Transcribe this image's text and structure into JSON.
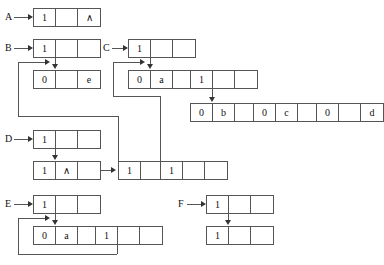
{
  "diagram": {
    "type": "pointer-diagram",
    "labels": [
      {
        "id": "A",
        "text": "A",
        "x": 5,
        "y": 12
      },
      {
        "id": "B",
        "text": "B",
        "x": 5,
        "y": 43
      },
      {
        "id": "C",
        "text": "C",
        "x": 103,
        "y": 43
      },
      {
        "id": "D",
        "text": "D",
        "x": 5,
        "y": 134
      },
      {
        "id": "E",
        "text": "E",
        "x": 5,
        "y": 199
      },
      {
        "id": "F",
        "text": "F",
        "x": 178,
        "y": 199
      }
    ],
    "nodes": [
      {
        "id": "A1",
        "x": 33,
        "y": 8,
        "cells": [
          "1",
          "",
          "∧"
        ]
      },
      {
        "id": "B1",
        "x": 33,
        "y": 39,
        "cells": [
          "1",
          "",
          ""
        ]
      },
      {
        "id": "B2",
        "x": 33,
        "y": 70,
        "cells": [
          "0",
          "",
          "e"
        ]
      },
      {
        "id": "C1",
        "x": 128,
        "y": 39,
        "cells": [
          "1",
          "",
          ""
        ]
      },
      {
        "id": "C2",
        "x": 128,
        "y": 70,
        "cells": [
          "0",
          "a",
          ""
        ]
      },
      {
        "id": "C3",
        "x": 190,
        "y": 70,
        "cells": [
          "1",
          "",
          ""
        ]
      },
      {
        "id": "C4",
        "x": 190,
        "y": 103,
        "cells": [
          "0",
          "b",
          ""
        ]
      },
      {
        "id": "C5",
        "x": 253,
        "y": 103,
        "cells": [
          "0",
          "c",
          ""
        ]
      },
      {
        "id": "C6",
        "x": 316,
        "y": 103,
        "cells": [
          "0",
          "",
          "d"
        ]
      },
      {
        "id": "D1",
        "x": 33,
        "y": 130,
        "cells": [
          "1",
          "",
          ""
        ]
      },
      {
        "id": "D2",
        "x": 33,
        "y": 161,
        "cells": [
          "1",
          "∧",
          ""
        ]
      },
      {
        "id": "D3",
        "x": 118,
        "y": 161,
        "cells": [
          "1",
          "",
          ""
        ]
      },
      {
        "id": "D4",
        "x": 160,
        "y": 161,
        "cells": [
          "1",
          "",
          ""
        ]
      },
      {
        "id": "E1",
        "x": 33,
        "y": 195,
        "cells": [
          "1",
          "",
          ""
        ]
      },
      {
        "id": "E2",
        "x": 33,
        "y": 226,
        "cells": [
          "0",
          "a",
          ""
        ]
      },
      {
        "id": "E3",
        "x": 95,
        "y": 226,
        "cells": [
          "1",
          "",
          ""
        ]
      },
      {
        "id": "F1",
        "x": 206,
        "y": 195,
        "cells": [
          "1",
          "",
          ""
        ]
      },
      {
        "id": "F2",
        "x": 206,
        "y": 226,
        "cells": [
          "1",
          "",
          ""
        ]
      }
    ],
    "cell_values": {
      "wedge": "∧",
      "one": "1",
      "zero": "0",
      "a": "a",
      "b": "b",
      "c": "c",
      "d": "d",
      "e": "e"
    },
    "colors": {
      "stroke": "#555555",
      "arrow": "#333333",
      "text": "#111111",
      "background": "#ffffff"
    }
  }
}
